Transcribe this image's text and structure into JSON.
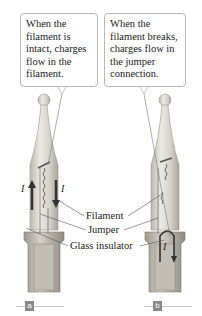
{
  "panels": [
    {
      "id": "a",
      "callout": "When the filament is intact, charges flow in the filament.",
      "tag": "a",
      "current_labels": [
        "I",
        "I"
      ]
    },
    {
      "id": "b",
      "callout": "When the filament breaks, charges flow in the jumper connection.",
      "tag": "b",
      "current_labels": [
        "I"
      ]
    }
  ],
  "labels": {
    "filament": "Filament",
    "jumper": "Jumper",
    "glass_insulator": "Glass insulator"
  },
  "colors": {
    "bulb_glass": "#d8d4cc",
    "arrow": "#3a3a3a",
    "tag_bg": "#8a8a8a"
  }
}
